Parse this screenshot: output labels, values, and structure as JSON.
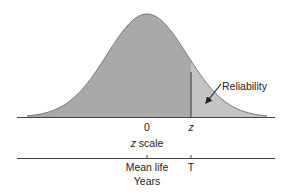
{
  "figure": {
    "type": "normal-distribution-reliability-diagram",
    "curve": {
      "mean_x": 147,
      "sigma_px": 40,
      "peak_y": 14,
      "baseline_y": 117,
      "x_start": 27,
      "x_end": 267
    },
    "cutoff_x": 191,
    "colors": {
      "body_fill": "#a9a9a9",
      "tail_fill": "#c4c4c4",
      "curve_stroke": "#7a7a7a",
      "axis_line": "#444444",
      "cutoff_line": "#333333",
      "text": "#222222"
    },
    "annotation": {
      "label": "Reliability",
      "arrow_from": [
        221,
        84
      ],
      "arrow_to": [
        205,
        104
      ]
    },
    "z_axis": {
      "zero_label": "0",
      "z_label": "z",
      "axis_title_var": "z",
      "axis_title_rest": " scale"
    },
    "time_axis": {
      "mean_label": "Mean life",
      "t_label": "T",
      "axis_title": "Years"
    }
  }
}
